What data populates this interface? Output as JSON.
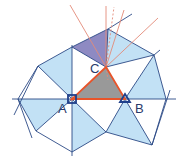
{
  "diagram": {
    "type": "geometric-construction",
    "labels": {
      "A": "A",
      "B": "B",
      "C": "C"
    },
    "colors": {
      "light_fill": "#bfe0f4",
      "dark_fill": "#8c88bf",
      "triangle_fill": "#9a9a9a",
      "triangle_edge": "#e8542a",
      "construction_line": "#2b4a86",
      "ray_color": "#e07a6a",
      "marker_A": "#1f3f8a",
      "marker_B": "#1f3f8a"
    },
    "points": {
      "A": [
        72,
        99
      ],
      "B": [
        125,
        99
      ],
      "C": [
        106,
        67
      ]
    },
    "markers": {
      "A": "square",
      "B": "triangle"
    }
  }
}
